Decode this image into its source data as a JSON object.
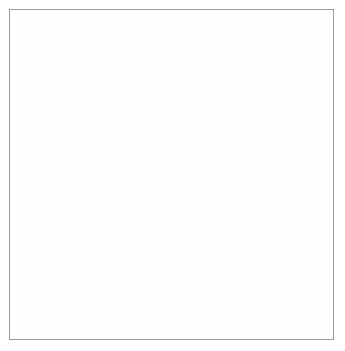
{
  "figure": {
    "kind": "biological-life-cycle-diagram",
    "title": "",
    "frame": {
      "x": 9,
      "y": 9,
      "width": 325,
      "height": 331,
      "border_color": "#9b9b9b"
    },
    "background_color": "#ffffff",
    "canvas": {
      "width": 345,
      "height": 351
    }
  },
  "palette": {
    "outline": "#6e6e6e",
    "arrow": "#5a5a5a",
    "cell_light_fill": "#c9c9c9",
    "cell_mid_fill": "#b2b2b2",
    "cell_dark_fill": "#a4a4a4",
    "organelle_dark": "#4a4a4a",
    "organelle_mid": "#6d6d6d",
    "speckle": "#7a7a7a",
    "halo": "#cfcfcf",
    "label_color": "#2b2b2b"
  },
  "stages": [
    {
      "id": "A",
      "label": "A",
      "label_x": 120,
      "label_y": 30,
      "description": "single host cell with nucleus",
      "cx": 155,
      "cy": 44,
      "r": 21,
      "fill": "#bdbdbd",
      "nucleus": {
        "cx": 155,
        "cy": 44,
        "r": 5.5,
        "fill": "#6d6d6d"
      },
      "inclusions": []
    },
    {
      "id": "B",
      "label": "B",
      "label_x": 231,
      "label_y": 95,
      "description": "cell packed with replicating dark bodies and speckled cytoplasm",
      "cx": 256,
      "cy": 50,
      "rx": 28,
      "ry": 26,
      "fill": "#c3c3c3",
      "inclusions": [
        {
          "cx": 248,
          "cy": 38,
          "r": 6.5
        },
        {
          "cx": 262,
          "cy": 39,
          "r": 6.5
        },
        {
          "cx": 242,
          "cy": 49,
          "r": 6.5
        },
        {
          "cx": 256,
          "cy": 50,
          "r": 6.5
        },
        {
          "cx": 269,
          "cy": 49,
          "r": 6.5
        },
        {
          "cx": 250,
          "cy": 60,
          "r": 6.5
        },
        {
          "cx": 264,
          "cy": 61,
          "r": 6.5
        }
      ],
      "speckled": true
    },
    {
      "id": "C",
      "label": "C",
      "label_x": 280,
      "label_y": 134,
      "description": "cell with several large vacuolated inclusions",
      "cx": 305,
      "cy": 127,
      "r": 21,
      "fill": "#c3c3c3",
      "inclusions": [
        {
          "cx": 304,
          "cy": 115,
          "r": 7
        },
        {
          "cx": 295,
          "cy": 130,
          "r": 7
        },
        {
          "cx": 311,
          "cy": 129,
          "r": 7
        },
        {
          "cx": 303,
          "cy": 141,
          "r": 7
        }
      ],
      "speckled": true
    },
    {
      "id": "D",
      "label": "D",
      "label_x": 231,
      "label_y": 238,
      "description": "cell with many small dark granules and peripheral textured bodies",
      "cx": 216,
      "cy": 199,
      "rx": 32,
      "ry": 34,
      "fill": "#c9c9c9",
      "granules": [
        {
          "cx": 213,
          "cy": 175,
          "r": 4
        },
        {
          "cx": 202,
          "cy": 185,
          "r": 4
        },
        {
          "cx": 220,
          "cy": 186,
          "r": 4
        },
        {
          "cx": 209,
          "cy": 194,
          "r": 4
        },
        {
          "cx": 226,
          "cy": 195,
          "r": 4
        },
        {
          "cx": 199,
          "cy": 200,
          "r": 4
        },
        {
          "cx": 216,
          "cy": 203,
          "r": 4
        },
        {
          "cx": 205,
          "cy": 210,
          "r": 4
        },
        {
          "cx": 223,
          "cy": 211,
          "r": 4
        },
        {
          "cx": 212,
          "cy": 218,
          "r": 4
        },
        {
          "cx": 229,
          "cy": 178,
          "r": 4
        },
        {
          "cx": 197,
          "cy": 214,
          "r": 4
        }
      ],
      "peripheral_bodies": [
        {
          "cx": 199,
          "cy": 177,
          "r": 7
        },
        {
          "cx": 235,
          "cy": 184,
          "r": 7
        },
        {
          "cx": 191,
          "cy": 205,
          "r": 7
        },
        {
          "cx": 240,
          "cy": 207,
          "r": 7
        },
        {
          "cx": 205,
          "cy": 226,
          "r": 7
        },
        {
          "cx": 228,
          "cy": 227,
          "r": 7
        }
      ]
    },
    {
      "id": "E",
      "label": "E",
      "label_x": 296,
      "label_y": 311,
      "description": "cell with central cluster of textured bodies ringed by dark granules",
      "cx": 293,
      "cy": 272,
      "r": 30,
      "fill": "#c0c0c0",
      "central_bodies": [
        {
          "cx": 285,
          "cy": 264,
          "r": 7
        },
        {
          "cx": 298,
          "cy": 262,
          "r": 7
        },
        {
          "cx": 279,
          "cy": 275,
          "r": 7
        },
        {
          "cx": 292,
          "cy": 275,
          "r": 7
        },
        {
          "cx": 304,
          "cy": 273,
          "r": 7
        },
        {
          "cx": 288,
          "cy": 287,
          "r": 7
        }
      ],
      "granules": [
        {
          "cx": 283,
          "cy": 249,
          "r": 4
        },
        {
          "cx": 298,
          "cy": 248,
          "r": 4
        },
        {
          "cx": 310,
          "cy": 255,
          "r": 4
        },
        {
          "cx": 271,
          "cy": 257,
          "r": 4
        },
        {
          "cx": 316,
          "cy": 270,
          "r": 4
        },
        {
          "cx": 268,
          "cy": 272,
          "r": 4
        },
        {
          "cx": 313,
          "cy": 285,
          "r": 4
        },
        {
          "cx": 272,
          "cy": 288,
          "r": 4
        },
        {
          "cx": 303,
          "cy": 293,
          "r": 4
        },
        {
          "cx": 287,
          "cy": 297,
          "r": 4
        }
      ]
    },
    {
      "id": "F",
      "label": "F",
      "label_x": 61,
      "label_y": 300,
      "description": "large swollen cell with thick wall containing many daughter bodies",
      "cx": 125,
      "cy": 280,
      "r": 56,
      "fill": "#a8a8a8",
      "wall_color": "#b8b8b8",
      "wall_width": 7,
      "daughter_bodies": [
        {
          "cx": 95,
          "cy": 246,
          "r": 9
        },
        {
          "cx": 128,
          "cy": 243,
          "r": 9
        },
        {
          "cx": 160,
          "cy": 248,
          "r": 9
        },
        {
          "cx": 108,
          "cy": 265,
          "r": 9
        },
        {
          "cx": 140,
          "cy": 263,
          "r": 9
        },
        {
          "cx": 170,
          "cy": 268,
          "r": 9
        },
        {
          "cx": 85,
          "cy": 283,
          "r": 9
        },
        {
          "cx": 118,
          "cy": 282,
          "r": 9
        },
        {
          "cx": 151,
          "cy": 281,
          "r": 9
        },
        {
          "cx": 172,
          "cy": 292,
          "r": 9
        },
        {
          "cx": 96,
          "cy": 303,
          "r": 9
        },
        {
          "cx": 129,
          "cy": 302,
          "r": 9
        },
        {
          "cx": 158,
          "cy": 304,
          "r": 9
        },
        {
          "cx": 112,
          "cy": 320,
          "r": 9
        }
      ],
      "attached_body": {
        "cx": 78,
        "cy": 228,
        "r": 9
      }
    },
    {
      "id": "G",
      "label": "G",
      "label_x": 64,
      "label_y": 156,
      "description": "free bodies shedding dispersing halo of fine material",
      "halo_forms": [
        {
          "cx": 30,
          "cy": 166,
          "r": 9,
          "halo_r": 19
        },
        {
          "cx": 95,
          "cy": 158,
          "r": 9,
          "halo_r": 18
        },
        {
          "cx": 78,
          "cy": 228,
          "r": 9,
          "halo_r": 17
        }
      ]
    },
    {
      "id": "H",
      "label": "H",
      "label_x": 40,
      "label_y": 97,
      "description": "cluster of released infective particles",
      "particles": [
        {
          "cx": 48,
          "cy": 72,
          "r": 5
        },
        {
          "cx": 65,
          "cy": 70,
          "r": 5
        },
        {
          "cx": 42,
          "cy": 83,
          "r": 5
        },
        {
          "cx": 58,
          "cy": 81,
          "r": 5
        },
        {
          "cx": 72,
          "cy": 80,
          "r": 5
        },
        {
          "cx": 52,
          "cy": 92,
          "r": 5
        },
        {
          "cx": 68,
          "cy": 91,
          "r": 5
        }
      ]
    },
    {
      "id": "J",
      "label": "J",
      "label_x": 146,
      "label_y": 120,
      "description": "single particle amid scattered cellular debris",
      "particle": {
        "cx": 126,
        "cy": 110,
        "r": 5.5
      },
      "debris_clusters": [
        {
          "cx": 110,
          "cy": 98
        },
        {
          "cx": 133,
          "cy": 97
        },
        {
          "cx": 110,
          "cy": 118
        },
        {
          "cx": 136,
          "cy": 117
        }
      ]
    }
  ],
  "arrows": [
    {
      "id": "A-to-B",
      "from": "A",
      "to": "B",
      "path": "M 178 42 C 198 36, 212 36, 226 40"
    },
    {
      "id": "B-to-C",
      "from": "B",
      "to": "C",
      "path": "M 278 70 C 288 84, 294 98, 299 106"
    },
    {
      "id": "C-to-D",
      "from": "C",
      "to": "D",
      "path": "M 298 150 C 282 168, 268 180, 252 189"
    },
    {
      "id": "C-to-E",
      "from": "C",
      "to": "E",
      "path": "M 322 141 C 334 170, 332 210, 316 243"
    },
    {
      "id": "D-to-F",
      "from": "D",
      "to": "F",
      "path": "M 190 227 C 180 236, 172 240, 163 243"
    },
    {
      "id": "E-to-F",
      "from": "E",
      "to": "F",
      "path": "M 300 305 C 278 334, 180 346, 122 337"
    },
    {
      "id": "F-to-G",
      "from": "F",
      "to": "G",
      "path": "M 72 222 C 62 205, 58 186, 58 172"
    },
    {
      "id": "G-to-H",
      "from": "G",
      "to": "H",
      "path": "M 56 148 C 54 130, 55 116, 56 106"
    },
    {
      "id": "H-to-A",
      "from": "H",
      "to": "A",
      "path": "M 80 76 C 104 66, 122 56, 134 48"
    },
    {
      "id": "A-to-G",
      "from": "A",
      "to": "G",
      "path": "M 166 64 C 172 100, 172 140, 150 155 C 138 162, 122 160, 112 158"
    },
    {
      "id": "J-to-A",
      "from": "J",
      "to": "A",
      "path": "M 134 110 C 148 110, 152 104, 152 88 C 152 78, 152 72, 152 66"
    }
  ]
}
